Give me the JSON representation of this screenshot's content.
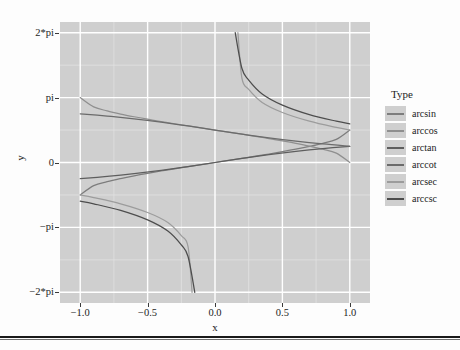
{
  "chart_data": {
    "type": "line",
    "title": "",
    "xlabel": "x",
    "ylabel": "y",
    "xlim": [
      -1.15,
      1.15
    ],
    "ylim": [
      -6.8,
      6.8
    ],
    "grid": true,
    "legend_position": "right",
    "legend_title": "Type",
    "x_ticks": [
      {
        "value": -1.0,
        "label": "−1.0"
      },
      {
        "value": -0.5,
        "label": "−0.5"
      },
      {
        "value": 0.0,
        "label": "0.0"
      },
      {
        "value": 0.5,
        "label": "0.5"
      },
      {
        "value": 1.0,
        "label": "1.0"
      }
    ],
    "y_ticks": [
      {
        "value": 6.283185,
        "label": "2*pi"
      },
      {
        "value": 3.141593,
        "label": "pi"
      },
      {
        "value": 0.0,
        "label": "0"
      },
      {
        "value": -3.141593,
        "label": "−pi"
      },
      {
        "value": -6.283185,
        "label": "−2*pi"
      }
    ],
    "panel_background": "#cfcfcf",
    "grid_color": "#ffffff",
    "series": [
      {
        "name": "arcsin",
        "color": "#7d7d7d",
        "domain": [
          -1.0,
          1.0
        ],
        "x": [
          -1.0,
          -0.9,
          -0.8,
          -0.7,
          -0.6,
          -0.5,
          -0.4,
          -0.3,
          -0.2,
          -0.1,
          0.0,
          0.1,
          0.2,
          0.3,
          0.4,
          0.5,
          0.6,
          0.7,
          0.8,
          0.9,
          1.0
        ],
        "y": [
          -1.5708,
          -1.1198,
          -0.9273,
          -0.7754,
          -0.6435,
          -0.5236,
          -0.4115,
          -0.3047,
          -0.2014,
          -0.1002,
          0.0,
          0.1002,
          0.2014,
          0.3047,
          0.4115,
          0.5236,
          0.6435,
          0.7754,
          0.9273,
          1.1198,
          1.5708
        ]
      },
      {
        "name": "arccos",
        "color": "#8f8f8f",
        "domain": [
          -1.0,
          1.0
        ],
        "x": [
          -1.0,
          -0.9,
          -0.8,
          -0.7,
          -0.6,
          -0.5,
          -0.4,
          -0.3,
          -0.2,
          -0.1,
          0.0,
          0.1,
          0.2,
          0.3,
          0.4,
          0.5,
          0.6,
          0.7,
          0.8,
          0.9,
          1.0
        ],
        "y": [
          3.1416,
          2.6906,
          2.4981,
          2.3462,
          2.2143,
          2.0944,
          1.9823,
          1.8755,
          1.7722,
          1.671,
          1.5708,
          1.4706,
          1.3694,
          1.2661,
          1.1593,
          1.0472,
          0.9273,
          0.7954,
          0.6435,
          0.451,
          0.0
        ]
      },
      {
        "name": "arctan",
        "color": "#5e5e5e",
        "domain": [
          -1.0,
          1.0
        ],
        "x": [
          -1.0,
          -0.8,
          -0.6,
          -0.4,
          -0.2,
          0.0,
          0.2,
          0.4,
          0.6,
          0.8,
          1.0
        ],
        "y": [
          -0.7854,
          -0.6747,
          -0.5404,
          -0.3805,
          -0.1974,
          0.0,
          0.1974,
          0.3805,
          0.5404,
          0.6747,
          0.7854
        ]
      },
      {
        "name": "arccot",
        "color": "#6b6b6b",
        "domain": [
          -1.0,
          1.0
        ],
        "x": [
          -1.0,
          -0.8,
          -0.6,
          -0.4,
          -0.2,
          0.0,
          0.2,
          0.4,
          0.6,
          0.8,
          1.0
        ],
        "y": [
          2.3562,
          2.2455,
          2.1112,
          1.9513,
          1.7682,
          1.5708,
          1.3734,
          1.1903,
          1.0304,
          0.8961,
          0.7854
        ]
      },
      {
        "name": "arcsec",
        "color": "#9c9c9c",
        "domain": [
          -1.0,
          1.0
        ],
        "note": "branch diverges toward 2*pi near x=0.17 and toward -2*pi near x=-0.17",
        "x": [
          -1.0,
          -0.9,
          -0.7,
          -0.5,
          -0.35,
          -0.25,
          -0.2,
          -0.17,
          0.17,
          0.2,
          0.25,
          0.35,
          0.5,
          0.7,
          0.9,
          1.0
        ],
        "y": [
          -1.5708,
          -1.6949,
          -1.9978,
          -2.4189,
          -2.9026,
          -3.5345,
          -4.0689,
          -6.2832,
          6.2832,
          4.0689,
          3.5345,
          2.9026,
          2.4189,
          1.9978,
          1.6949,
          1.5708
        ]
      },
      {
        "name": "arccsc",
        "color": "#4d4d4d",
        "domain": [
          -1.0,
          1.0
        ],
        "note": "branch diverges toward 2*pi near x=0.15 and toward -2*pi near x=-0.15",
        "x": [
          -1.0,
          -0.9,
          -0.7,
          -0.5,
          -0.35,
          -0.25,
          -0.2,
          -0.15,
          0.15,
          0.2,
          0.25,
          0.35,
          0.5,
          0.7,
          0.9,
          1.0
        ],
        "y": [
          -1.8708,
          -2.0,
          -2.32,
          -2.78,
          -3.32,
          -3.99,
          -4.55,
          -6.2832,
          6.2832,
          4.55,
          3.99,
          3.32,
          2.78,
          2.32,
          2.0,
          1.8708
        ]
      }
    ]
  },
  "axes": {
    "x_title": "x",
    "y_title": "y"
  },
  "legend": {
    "title": "Type",
    "items": [
      {
        "label": "arcsin",
        "color": "#7d7d7d"
      },
      {
        "label": "arccos",
        "color": "#8f8f8f"
      },
      {
        "label": "arctan",
        "color": "#5e5e5e"
      },
      {
        "label": "arccot",
        "color": "#6b6b6b"
      },
      {
        "label": "arcsec",
        "color": "#9c9c9c"
      },
      {
        "label": "arccsc",
        "color": "#4d4d4d"
      }
    ]
  }
}
